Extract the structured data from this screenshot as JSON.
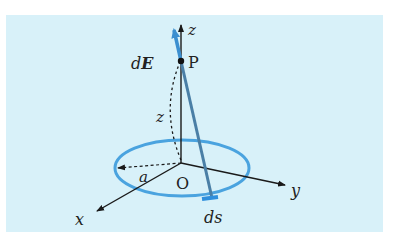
{
  "diagram": {
    "colors": {
      "background": "#d8f1f9",
      "ring": "#4aa3df",
      "field_vector": "#3b8fd0",
      "line_to_P": "#4a7fa6",
      "axes": "#1a1a1a"
    },
    "labels": {
      "z_axis": "z",
      "y_axis": "y",
      "x_axis": "x",
      "origin": "O",
      "point": "P",
      "field": "dE",
      "field_d": "d",
      "field_E": "E",
      "height": "z",
      "radius": "a",
      "element": "ds"
    }
  }
}
